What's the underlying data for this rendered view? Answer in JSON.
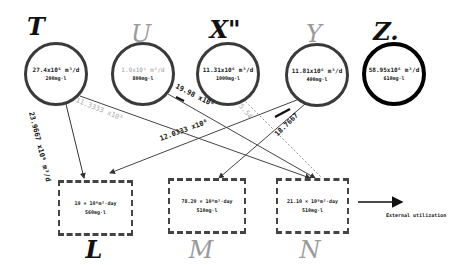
{
  "diagram": {
    "sources": [
      {
        "id": "T",
        "title": "T",
        "rate": "27.4x10⁶ m³/d",
        "concentration": "200mg·l",
        "style": "dark"
      },
      {
        "id": "U",
        "title": "U",
        "rate": "1.9x10⁶ m³/d",
        "concentration": "800mg·l",
        "style": "faint"
      },
      {
        "id": "X",
        "title": "X\"",
        "rate": "11.31x10⁶ m³/d",
        "concentration": "1000mg·l",
        "style": "dark"
      },
      {
        "id": "Y",
        "title": "Y",
        "rate": "11.81x10⁶ m³/d",
        "concentration": "400mg·l",
        "style": "faint"
      },
      {
        "id": "Z",
        "title": "Z.",
        "rate": "58.95x10⁶ m³/d",
        "concentration": "610mg·l",
        "style": "bold"
      }
    ],
    "sinks": [
      {
        "id": "L",
        "title": "L",
        "rate": "19 × 10⁶m³·day",
        "concentration": "560mg·l",
        "style": "dark"
      },
      {
        "id": "M",
        "title": "M",
        "rate": "78.20 × 10⁶m³·day",
        "concentration": "510mg·l",
        "style": "faint"
      },
      {
        "id": "N",
        "title": "N",
        "rate": "21.10 × 10⁶m³·day",
        "concentration": "510mg·l",
        "style": "faint"
      }
    ],
    "flows": [
      {
        "from": "T",
        "to": "L",
        "label": "23.9667 x10⁶ m³/d",
        "style": "dark"
      },
      {
        "from": "T",
        "to": "N",
        "label": "11.3333 x10⁶",
        "style": "mixed"
      },
      {
        "from": "U",
        "to": "N",
        "label": "19.98 x10⁶",
        "style": "dark"
      },
      {
        "from": "Y",
        "to": "L",
        "label": "12.0333 x10⁶",
        "style": "dark"
      },
      {
        "from": "Y",
        "to": "M",
        "label": "18.7667",
        "style": "dark"
      },
      {
        "from": "X",
        "to": "N",
        "label": "5.54",
        "style": "faint"
      }
    ],
    "external_flow": {
      "label": "External utilization",
      "arrow": "arrow-right-icon"
    }
  }
}
